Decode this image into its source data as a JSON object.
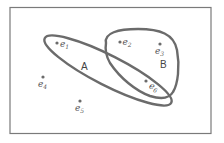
{
  "diagram": {
    "type": "hypergraph",
    "colors": {
      "stroke": "#6b6b6b",
      "frame": "#7a7a7a",
      "text": "#555555",
      "background": "#ffffff"
    },
    "vertices": [
      {
        "id": "e1",
        "base": "e",
        "sub": "1",
        "x": 57,
        "y": 43,
        "label_x": 61,
        "label_y": 47
      },
      {
        "id": "e2",
        "base": "e",
        "sub": "2",
        "x": 120,
        "y": 42,
        "label_x": 123,
        "label_y": 45
      },
      {
        "id": "e3",
        "base": "e",
        "sub": "3",
        "x": 160,
        "y": 44,
        "label_x": 155,
        "label_y": 55
      },
      {
        "id": "e4",
        "base": "e",
        "sub": "4",
        "x": 43,
        "y": 77,
        "label_x": 38,
        "label_y": 88
      },
      {
        "id": "e5",
        "base": "e",
        "sub": "5",
        "x": 80,
        "y": 101,
        "label_x": 75,
        "label_y": 112
      },
      {
        "id": "e6",
        "base": "e",
        "sub": "6",
        "x": 146,
        "y": 81,
        "label_x": 149,
        "label_y": 90
      }
    ],
    "hyperedges": [
      {
        "id": "A",
        "label": "A",
        "label_x": 81,
        "label_y": 70,
        "members": [
          "e1",
          "e6"
        ]
      },
      {
        "id": "B",
        "label": "B",
        "label_x": 160,
        "label_y": 68,
        "members": [
          "e2",
          "e3",
          "e6"
        ]
      }
    ]
  }
}
